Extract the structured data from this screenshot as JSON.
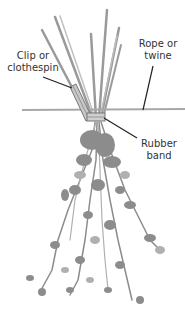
{
  "figure": {
    "colors": {
      "stem": "#9a9a9a",
      "stem_dark": "#7a7a7a",
      "foliage": "#8c8c8c",
      "foliage_light": "#b0b0b0",
      "rope": "#a8a8a8",
      "leader": "#222222",
      "text": "#333333"
    }
  },
  "labels": {
    "clip": {
      "line1": "Clip or",
      "line2": "clothespin"
    },
    "rope": {
      "line1": "Rope or",
      "line2": "twine"
    },
    "band": {
      "line1": "Rubber",
      "line2": "band"
    }
  }
}
